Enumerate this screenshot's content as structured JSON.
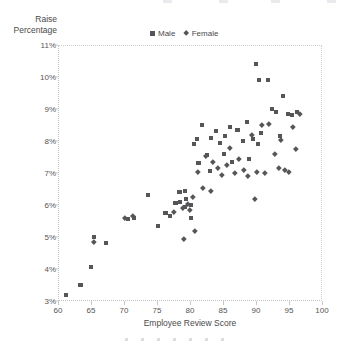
{
  "chart_data": {
    "type": "scatter",
    "title": "",
    "xlabel": "Employee Review Score",
    "ylabel": "Raise Percentage",
    "xlim": [
      60,
      100
    ],
    "ylim": [
      3,
      11
    ],
    "xticks": [
      60,
      65,
      70,
      75,
      80,
      85,
      90,
      95,
      100
    ],
    "xtick_labels": [
      "60",
      "65",
      "70",
      "75",
      "80",
      "85",
      "90",
      "95",
      "100"
    ],
    "yticks": [
      3,
      4,
      5,
      6,
      7,
      8,
      9,
      10,
      11
    ],
    "ytick_labels": [
      "3%",
      "4%",
      "5%",
      "6%",
      "7%",
      "8%",
      "9%",
      "10%",
      "11%"
    ],
    "grid": false,
    "legend_position": "top-center",
    "marker_color": "#565659",
    "series": [
      {
        "name": "Male",
        "marker": "square",
        "points": [
          [
            61.2,
            3.2
          ],
          [
            63.4,
            3.5
          ],
          [
            65.0,
            4.05
          ],
          [
            65.5,
            5.0
          ],
          [
            67.3,
            4.8
          ],
          [
            70.6,
            5.55
          ],
          [
            71.5,
            5.6
          ],
          [
            73.6,
            6.3
          ],
          [
            75.1,
            5.35
          ],
          [
            76.3,
            5.75
          ],
          [
            77.0,
            5.65
          ],
          [
            77.8,
            6.05
          ],
          [
            78.4,
            6.4
          ],
          [
            78.5,
            6.1
          ],
          [
            79.2,
            5.95
          ],
          [
            79.3,
            6.45
          ],
          [
            79.4,
            6.2
          ],
          [
            80.1,
            6.0
          ],
          [
            80.2,
            5.6
          ],
          [
            80.6,
            7.9
          ],
          [
            81.0,
            8.05
          ],
          [
            81.3,
            7.3
          ],
          [
            81.8,
            8.5
          ],
          [
            82.6,
            7.55
          ],
          [
            83.0,
            7.05
          ],
          [
            83.2,
            8.1
          ],
          [
            84.0,
            8.3
          ],
          [
            84.5,
            7.95
          ],
          [
            85.1,
            7.6
          ],
          [
            85.3,
            8.15
          ],
          [
            86.0,
            8.45
          ],
          [
            86.4,
            7.35
          ],
          [
            87.2,
            8.35
          ],
          [
            88.0,
            8.0
          ],
          [
            88.6,
            8.6
          ],
          [
            89.0,
            7.45
          ],
          [
            89.6,
            8.05
          ],
          [
            90.0,
            10.4
          ],
          [
            90.3,
            7.9
          ],
          [
            90.5,
            9.9
          ],
          [
            90.8,
            8.25
          ],
          [
            91.8,
            9.9
          ],
          [
            92.4,
            9.0
          ],
          [
            93.0,
            8.9
          ],
          [
            93.6,
            8.15
          ],
          [
            94.1,
            9.4
          ],
          [
            94.8,
            8.85
          ],
          [
            95.4,
            8.8
          ],
          [
            96.2,
            8.9
          ]
        ]
      },
      {
        "name": "Female",
        "marker": "diamond",
        "points": [
          [
            65.4,
            4.85
          ],
          [
            70.2,
            5.6
          ],
          [
            71.3,
            5.65
          ],
          [
            77.5,
            5.8
          ],
          [
            78.9,
            5.9
          ],
          [
            79.0,
            4.95
          ],
          [
            79.6,
            6.05
          ],
          [
            80.0,
            5.85
          ],
          [
            80.4,
            6.25
          ],
          [
            80.8,
            5.2
          ],
          [
            81.2,
            7.05
          ],
          [
            82.0,
            6.55
          ],
          [
            82.4,
            7.55
          ],
          [
            83.1,
            6.45
          ],
          [
            83.4,
            7.35
          ],
          [
            84.2,
            7.15
          ],
          [
            84.8,
            6.95
          ],
          [
            85.6,
            7.25
          ],
          [
            86.1,
            7.8
          ],
          [
            86.8,
            7.0
          ],
          [
            87.4,
            7.45
          ],
          [
            88.2,
            7.1
          ],
          [
            88.8,
            6.9
          ],
          [
            89.3,
            8.2
          ],
          [
            89.8,
            6.2
          ],
          [
            90.2,
            7.05
          ],
          [
            90.9,
            8.5
          ],
          [
            91.4,
            7.0
          ],
          [
            92.0,
            8.55
          ],
          [
            92.8,
            7.6
          ],
          [
            93.4,
            7.15
          ],
          [
            93.8,
            8.05
          ],
          [
            94.4,
            7.1
          ],
          [
            95.0,
            7.05
          ],
          [
            95.6,
            8.45
          ],
          [
            96.0,
            7.75
          ],
          [
            96.6,
            8.85
          ]
        ]
      }
    ]
  },
  "legend": {
    "entries": [
      {
        "label": "Male",
        "marker": "square"
      },
      {
        "label": "Female",
        "marker": "diamond"
      }
    ]
  },
  "pagination": {
    "dot_count": 7,
    "color": "#dcdcdc"
  },
  "top_edge_marks": {
    "count": 4,
    "positions": [
      163,
      219,
      271,
      327
    ]
  }
}
